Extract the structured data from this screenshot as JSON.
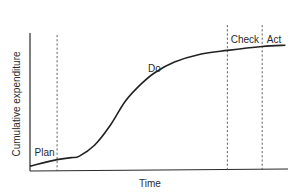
{
  "chart_data": {
    "type": "line",
    "title": "",
    "xlabel": "Time",
    "ylabel": "Cumulative expenditure",
    "grid": false,
    "legend": "none",
    "xlim": [
      0,
      100
    ],
    "ylim": [
      0,
      100
    ],
    "series": [
      {
        "name": "Cumulative expenditure",
        "x": [
          0,
          10.5,
          16,
          19,
          25,
          31,
          37,
          43,
          48.5,
          56,
          66,
          76.5,
          90,
          99
        ],
        "y": [
          3,
          8,
          9.5,
          10.5,
          19,
          34,
          53,
          66,
          75,
          83,
          89,
          92,
          95,
          96
        ]
      }
    ],
    "phase_boundaries": [
      10.5,
      76.5,
      90
    ],
    "phases": [
      {
        "label": "Plan",
        "x": 1,
        "y": 13
      },
      {
        "label": "Do",
        "x": 45,
        "y": 78
      },
      {
        "label": "Check",
        "x": 77,
        "y": 100
      },
      {
        "label": "Act",
        "x": 91,
        "y": 100
      }
    ]
  }
}
